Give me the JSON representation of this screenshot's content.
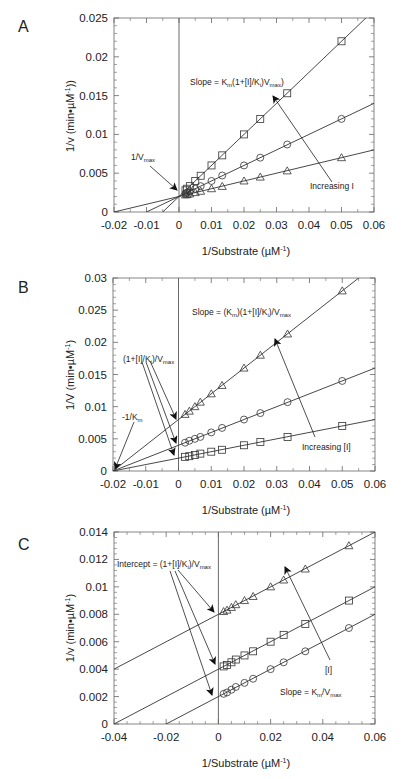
{
  "chart_data": [
    {
      "panel": "A",
      "type": "line",
      "title": "Competitive inhibition (Lineweaver-Burk)",
      "xlabel": "1/Substrate (µM⁻¹)",
      "ylabel": "1/v (min•µM⁻¹)",
      "xlim": [
        -0.02,
        0.06
      ],
      "ylim": [
        0,
        0.025
      ],
      "xticks": [
        "-0.02",
        "-0.01",
        "0",
        "0.01",
        "0.02",
        "0.03",
        "0.04",
        "0.05",
        "0.06"
      ],
      "yticks": [
        "0",
        "0.005",
        "0.01",
        "0.015",
        "0.02",
        "0.025"
      ],
      "grid": false,
      "x": [
        0.002,
        0.0025,
        0.00333,
        0.005,
        0.00667,
        0.01,
        0.0133,
        0.02,
        0.025,
        0.0333,
        0.05
      ],
      "series": [
        {
          "name": "squares",
          "marker": "square",
          "intercept": 0.002,
          "slope": 0.4,
          "values": [
            0.0028,
            0.003,
            0.00333,
            0.004,
            0.00467,
            0.006,
            0.0073,
            0.01,
            0.012,
            0.0153,
            0.022
          ]
        },
        {
          "name": "circles",
          "marker": "circle",
          "intercept": 0.002,
          "slope": 0.2,
          "values": [
            0.0024,
            0.0025,
            0.00267,
            0.003,
            0.00333,
            0.004,
            0.0047,
            0.006,
            0.007,
            0.0087,
            0.012
          ]
        },
        {
          "name": "triangles",
          "marker": "triangle",
          "intercept": 0.002,
          "slope": 0.1,
          "values": [
            0.0022,
            0.00225,
            0.00233,
            0.0025,
            0.00267,
            0.003,
            0.0033,
            0.004,
            0.0045,
            0.0053,
            0.007
          ]
        }
      ],
      "annotations": [
        {
          "text": "Slope = Km(1+[I]/Ki)Vmax)"
        },
        {
          "text": "1/Vmax"
        },
        {
          "text": "Increasing I"
        }
      ]
    },
    {
      "panel": "B",
      "type": "line",
      "title": "Noncompetitive inhibition (Lineweaver-Burk)",
      "xlabel": "1/Substrate (µM⁻¹)",
      "ylabel": "1/V (min•µM⁻¹)",
      "xlim": [
        -0.02,
        0.06
      ],
      "ylim": [
        0,
        0.03
      ],
      "xticks": [
        "-0.02",
        "-0.01",
        "0",
        "0.01",
        "0.02",
        "0.03",
        "0.04",
        "0.05",
        "0.06"
      ],
      "yticks": [
        "0",
        "0.005",
        "0.01",
        "0.015",
        "0.02",
        "0.025",
        "0.03"
      ],
      "grid": false,
      "x": [
        0.002,
        0.0033,
        0.005,
        0.00667,
        0.01,
        0.0133,
        0.02,
        0.025,
        0.0333,
        0.05
      ],
      "series": [
        {
          "name": "triangles",
          "marker": "triangle",
          "intercept": 0.008,
          "slope": 0.4,
          "values": [
            0.0088,
            0.0093,
            0.01,
            0.0107,
            0.012,
            0.0133,
            0.016,
            0.018,
            0.0213,
            0.028
          ]
        },
        {
          "name": "circles",
          "marker": "circle",
          "intercept": 0.004,
          "slope": 0.2,
          "values": [
            0.0044,
            0.0047,
            0.005,
            0.0053,
            0.006,
            0.0067,
            0.008,
            0.009,
            0.0107,
            0.014
          ]
        },
        {
          "name": "squares",
          "marker": "square",
          "intercept": 0.002,
          "slope": 0.1,
          "values": [
            0.0022,
            0.0023,
            0.0025,
            0.0027,
            0.003,
            0.0033,
            0.004,
            0.0045,
            0.0053,
            0.007
          ]
        }
      ],
      "annotations": [
        {
          "text": "Slope = (Km)(1+[I]/Ki)/Vmax"
        },
        {
          "text": "(1+[I]/Ki)/Vmax"
        },
        {
          "text": "-1/Km"
        },
        {
          "text": "Increasing [I]"
        }
      ]
    },
    {
      "panel": "C",
      "type": "line",
      "title": "Uncompetitive inhibition (Lineweaver-Burk)",
      "xlabel": "1/Substrate (µM⁻¹)",
      "ylabel": "1/v (min•µM⁻¹)",
      "xlim": [
        -0.04,
        0.06
      ],
      "ylim": [
        0,
        0.014
      ],
      "xticks": [
        "-0.04",
        "-0.02",
        "0",
        "0.02",
        "0.04",
        "0.06"
      ],
      "yticks": [
        "0",
        "0.002",
        "0.004",
        "0.006",
        "0.008",
        "0.01",
        "0.012",
        "0.014"
      ],
      "grid": false,
      "x": [
        0.002,
        0.0033,
        0.005,
        0.00667,
        0.01,
        0.0133,
        0.02,
        0.025,
        0.0333,
        0.05
      ],
      "series": [
        {
          "name": "triangles",
          "marker": "triangle",
          "intercept": 0.008,
          "slope": 0.1,
          "values": [
            0.0082,
            0.0083,
            0.0085,
            0.0087,
            0.009,
            0.0093,
            0.01,
            0.0105,
            0.0113,
            0.013
          ]
        },
        {
          "name": "squares",
          "marker": "square",
          "intercept": 0.004,
          "slope": 0.1,
          "values": [
            0.0042,
            0.0043,
            0.0045,
            0.0047,
            0.005,
            0.0053,
            0.006,
            0.0065,
            0.0073,
            0.009
          ]
        },
        {
          "name": "circles",
          "marker": "circle",
          "intercept": 0.002,
          "slope": 0.1,
          "values": [
            0.0022,
            0.0023,
            0.0025,
            0.0027,
            0.003,
            0.0033,
            0.004,
            0.0045,
            0.0053,
            0.007
          ]
        }
      ],
      "annotations": [
        {
          "text": "Intercept = (1+[I]/Ki)/Vmax"
        },
        {
          "text": "[I]"
        },
        {
          "text": "Slope = Km/Vmax"
        }
      ]
    }
  ],
  "panels": {
    "A": {
      "label": "A",
      "ylabel": "1/v (min•µM",
      "xlabel": "1/Substrate (µM",
      "ann_vmax": "1/V",
      "ann_incr": "Increasing I",
      "ann_slope_pre": "Slope = K",
      "ann_slope_mid": "(1+[I]/K",
      "ann_slope_mid2": ")V",
      "ann_slope_end": ")"
    },
    "B": {
      "label": "B",
      "ylabel": "1/V (min•µM",
      "xlabel": "1/Substrate (µM",
      "ann_slope_pre": "Slope = (K",
      "ann_slope_mid": ")(1+[I]/K",
      "ann_slope_end": ")/V",
      "ann_int": "(1+[I]/K",
      "ann_int2": ")/V",
      "ann_km": "-1/K",
      "ann_incr": "Increasing [I]"
    },
    "C": {
      "label": "C",
      "ylabel": "1/v (min•µM",
      "xlabel": "1/Substrate (µM",
      "ann_int": "Intercept = (1+[I]/K",
      "ann_int2": ")/V",
      "ann_i": "[I]",
      "ann_slope": "Slope = K",
      "ann_slope2": "/V"
    },
    "sub": {
      "m": "m",
      "i": "i",
      "max": "max",
      "neg1": "-1",
      "close": ")"
    }
  }
}
